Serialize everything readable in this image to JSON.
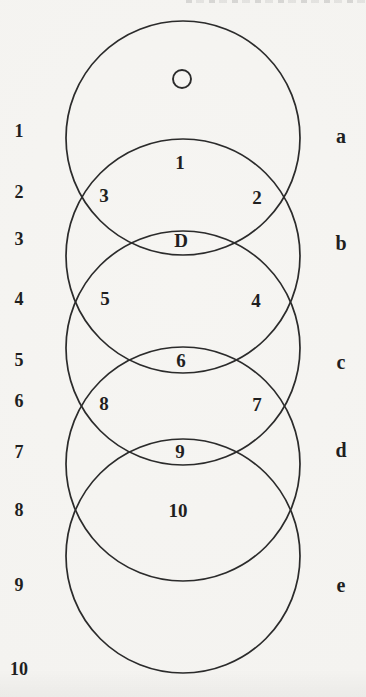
{
  "page": {
    "background": "#f4f3f0",
    "ink": "#1f1f1f",
    "stroke": "#2b2b2b"
  },
  "diagram": {
    "circles": [
      {
        "name": "a",
        "cx": 183,
        "cy": 138,
        "r": 117
      },
      {
        "name": "b",
        "cx": 183,
        "cy": 256,
        "r": 117
      },
      {
        "name": "c",
        "cx": 183,
        "cy": 348,
        "r": 117
      },
      {
        "name": "d",
        "cx": 183,
        "cy": 464,
        "r": 117
      },
      {
        "name": "e",
        "cx": 183,
        "cy": 556,
        "r": 117
      }
    ],
    "small_circle": {
      "cx": 182,
      "cy": 79,
      "r": 9
    },
    "region_labels": [
      {
        "text": "1",
        "x": 180,
        "y": 162
      },
      {
        "text": "3",
        "x": 104,
        "y": 195
      },
      {
        "text": "2",
        "x": 257,
        "y": 197
      },
      {
        "text": "D",
        "x": 181,
        "y": 240
      },
      {
        "text": "5",
        "x": 105,
        "y": 298
      },
      {
        "text": "4",
        "x": 256,
        "y": 300
      },
      {
        "text": "6",
        "x": 181,
        "y": 360
      },
      {
        "text": "8",
        "x": 104,
        "y": 403
      },
      {
        "text": "7",
        "x": 257,
        "y": 404
      },
      {
        "text": "9",
        "x": 180,
        "y": 451
      },
      {
        "text": "10",
        "x": 178,
        "y": 510
      }
    ],
    "left_labels": [
      {
        "text": "1",
        "y": 131
      },
      {
        "text": "2",
        "y": 192
      },
      {
        "text": "3",
        "y": 239
      },
      {
        "text": "4",
        "y": 299
      },
      {
        "text": "5",
        "y": 360
      },
      {
        "text": "6",
        "y": 401
      },
      {
        "text": "7",
        "y": 452
      },
      {
        "text": "8",
        "y": 510
      },
      {
        "text": "9",
        "y": 585
      },
      {
        "text": "10",
        "y": 669
      }
    ],
    "left_labels_x": 19,
    "right_labels": [
      {
        "text": "a",
        "y": 136
      },
      {
        "text": "b",
        "y": 243
      },
      {
        "text": "c",
        "y": 362
      },
      {
        "text": "d",
        "y": 450
      },
      {
        "text": "e",
        "y": 585
      }
    ],
    "right_labels_x": 341
  }
}
